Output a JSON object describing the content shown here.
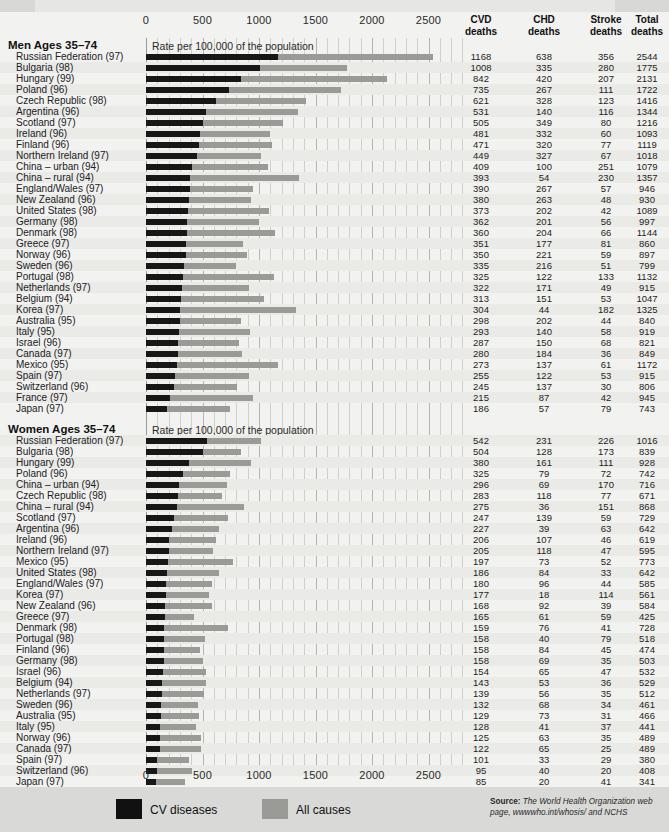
{
  "axis": {
    "ticks": [
      0,
      500,
      1000,
      1500,
      2000,
      2500
    ],
    "tick_labels": [
      "0",
      "500",
      "1000",
      "1500",
      "2000",
      "2500"
    ],
    "min": 0,
    "max": 2800,
    "rate_note": "Rate per 100,000 of the population"
  },
  "columns": {
    "cvd": "CVD\ndeaths",
    "cvd_l1": "CVD",
    "cvd_l2": "deaths",
    "chd_l1": "CHD",
    "chd_l2": "deaths",
    "stroke_l1": "Stroke",
    "stroke_l2": "deaths",
    "total_l1": "Total",
    "total_l2": "deaths"
  },
  "sections": [
    {
      "title": "Men Ages 35–74",
      "rows": [
        {
          "label": "Russian Federation (97)",
          "cvd": 1168,
          "chd": 638,
          "stroke": 356,
          "total": 2544
        },
        {
          "label": "Bulgaria (98)",
          "cvd": 1008,
          "chd": 335,
          "stroke": 280,
          "total": 1775
        },
        {
          "label": "Hungary (99)",
          "cvd": 842,
          "chd": 420,
          "stroke": 207,
          "total": 2131
        },
        {
          "label": "Poland (96)",
          "cvd": 735,
          "chd": 267,
          "stroke": 111,
          "total": 1722
        },
        {
          "label": "Czech Republic (98)",
          "cvd": 621,
          "chd": 328,
          "stroke": 123,
          "total": 1416
        },
        {
          "label": "Argentina (96)",
          "cvd": 531,
          "chd": 140,
          "stroke": 116,
          "total": 1344
        },
        {
          "label": "Scotland (97)",
          "cvd": 505,
          "chd": 349,
          "stroke": 80,
          "total": 1216
        },
        {
          "label": "Ireland (96)",
          "cvd": 481,
          "chd": 332,
          "stroke": 60,
          "total": 1093
        },
        {
          "label": "Finland (96)",
          "cvd": 471,
          "chd": 320,
          "stroke": 77,
          "total": 1119
        },
        {
          "label": "Northern Ireland (97)",
          "cvd": 449,
          "chd": 327,
          "stroke": 67,
          "total": 1018
        },
        {
          "label": "China – urban (94)",
          "cvd": 409,
          "chd": 100,
          "stroke": 251,
          "total": 1079
        },
        {
          "label": "China – rural (94)",
          "cvd": 393,
          "chd": 54,
          "stroke": 230,
          "total": 1357
        },
        {
          "label": "England/Wales (97)",
          "cvd": 390,
          "chd": 267,
          "stroke": 57,
          "total": 946
        },
        {
          "label": "New Zealand (96)",
          "cvd": 380,
          "chd": 263,
          "stroke": 48,
          "total": 930
        },
        {
          "label": "United States (98)",
          "cvd": 373,
          "chd": 202,
          "stroke": 42,
          "total": 1089
        },
        {
          "label": "Germany (98)",
          "cvd": 362,
          "chd": 201,
          "stroke": 56,
          "total": 997
        },
        {
          "label": "Denmark (98)",
          "cvd": 360,
          "chd": 204,
          "stroke": 66,
          "total": 1144
        },
        {
          "label": "Greece (97)",
          "cvd": 351,
          "chd": 177,
          "stroke": 81,
          "total": 860
        },
        {
          "label": "Norway (96)",
          "cvd": 350,
          "chd": 221,
          "stroke": 59,
          "total": 897
        },
        {
          "label": "Sweden (96)",
          "cvd": 335,
          "chd": 216,
          "stroke": 51,
          "total": 799
        },
        {
          "label": "Portugal (98)",
          "cvd": 325,
          "chd": 122,
          "stroke": 133,
          "total": 1132
        },
        {
          "label": "Netherlands (97)",
          "cvd": 322,
          "chd": 171,
          "stroke": 49,
          "total": 915
        },
        {
          "label": "Belgium (94)",
          "cvd": 313,
          "chd": 151,
          "stroke": 53,
          "total": 1047
        },
        {
          "label": "Korea (97)",
          "cvd": 304,
          "chd": 44,
          "stroke": 182,
          "total": 1325
        },
        {
          "label": "Australia (95)",
          "cvd": 298,
          "chd": 202,
          "stroke": 44,
          "total": 840
        },
        {
          "label": "Italy (95)",
          "cvd": 293,
          "chd": 140,
          "stroke": 58,
          "total": 919
        },
        {
          "label": "Israel (96)",
          "cvd": 287,
          "chd": 150,
          "stroke": 68,
          "total": 821
        },
        {
          "label": "Canada (97)",
          "cvd": 280,
          "chd": 184,
          "stroke": 36,
          "total": 849
        },
        {
          "label": "Mexico (95)",
          "cvd": 273,
          "chd": 137,
          "stroke": 61,
          "total": 1172
        },
        {
          "label": "Spain (97)",
          "cvd": 255,
          "chd": 122,
          "stroke": 53,
          "total": 915
        },
        {
          "label": "Switzerland (96)",
          "cvd": 245,
          "chd": 137,
          "stroke": 30,
          "total": 806
        },
        {
          "label": "France (97)",
          "cvd": 215,
          "chd": 87,
          "stroke": 42,
          "total": 945
        },
        {
          "label": "Japan (97)",
          "cvd": 186,
          "chd": 57,
          "stroke": 79,
          "total": 743
        }
      ]
    },
    {
      "title": "Women Ages 35–74",
      "rows": [
        {
          "label": "Russian Federation (97)",
          "cvd": 542,
          "chd": 231,
          "stroke": 226,
          "total": 1016
        },
        {
          "label": "Bulgaria (98)",
          "cvd": 504,
          "chd": 128,
          "stroke": 173,
          "total": 839
        },
        {
          "label": "Hungary (99)",
          "cvd": 380,
          "chd": 161,
          "stroke": 111,
          "total": 928
        },
        {
          "label": "Poland (96)",
          "cvd": 325,
          "chd": 79,
          "stroke": 72,
          "total": 742
        },
        {
          "label": "China – urban (94)",
          "cvd": 296,
          "chd": 69,
          "stroke": 170,
          "total": 716
        },
        {
          "label": "Czech Republic (98)",
          "cvd": 283,
          "chd": 118,
          "stroke": 77,
          "total": 671
        },
        {
          "label": "China – rural (94)",
          "cvd": 275,
          "chd": 36,
          "stroke": 151,
          "total": 868
        },
        {
          "label": "Scotland (97)",
          "cvd": 247,
          "chd": 139,
          "stroke": 59,
          "total": 729
        },
        {
          "label": "Argentina (96)",
          "cvd": 227,
          "chd": 39,
          "stroke": 63,
          "total": 642
        },
        {
          "label": "Ireland (96)",
          "cvd": 206,
          "chd": 107,
          "stroke": 46,
          "total": 619
        },
        {
          "label": "Northern Ireland (97)",
          "cvd": 205,
          "chd": 118,
          "stroke": 47,
          "total": 595
        },
        {
          "label": "Mexico (95)",
          "cvd": 197,
          "chd": 73,
          "stroke": 52,
          "total": 773
        },
        {
          "label": "United States (98)",
          "cvd": 186,
          "chd": 84,
          "stroke": 33,
          "total": 642
        },
        {
          "label": "England/Wales (97)",
          "cvd": 180,
          "chd": 96,
          "stroke": 44,
          "total": 585
        },
        {
          "label": "Korea (97)",
          "cvd": 177,
          "chd": 18,
          "stroke": 114,
          "total": 561
        },
        {
          "label": "New Zealand (96)",
          "cvd": 168,
          "chd": 92,
          "stroke": 39,
          "total": 584
        },
        {
          "label": "Greece (97)",
          "cvd": 165,
          "chd": 61,
          "stroke": 59,
          "total": 425
        },
        {
          "label": "Denmark (98)",
          "cvd": 159,
          "chd": 76,
          "stroke": 41,
          "total": 728
        },
        {
          "label": "Portugal (98)",
          "cvd": 158,
          "chd": 40,
          "stroke": 79,
          "total": 518
        },
        {
          "label": "Finland (96)",
          "cvd": 158,
          "chd": 84,
          "stroke": 45,
          "total": 474
        },
        {
          "label": "Germany (98)",
          "cvd": 158,
          "chd": 69,
          "stroke": 35,
          "total": 503
        },
        {
          "label": "Israel (96)",
          "cvd": 154,
          "chd": 65,
          "stroke": 47,
          "total": 532
        },
        {
          "label": "Belgium (94)",
          "cvd": 143,
          "chd": 53,
          "stroke": 36,
          "total": 529
        },
        {
          "label": "Netherlands (97)",
          "cvd": 139,
          "chd": 56,
          "stroke": 35,
          "total": 512
        },
        {
          "label": "Sweden (96)",
          "cvd": 132,
          "chd": 68,
          "stroke": 34,
          "total": 461
        },
        {
          "label": "Australia (95)",
          "cvd": 129,
          "chd": 73,
          "stroke": 31,
          "total": 466
        },
        {
          "label": "Italy (95)",
          "cvd": 128,
          "chd": 41,
          "stroke": 37,
          "total": 441
        },
        {
          "label": "Norway (96)",
          "cvd": 125,
          "chd": 63,
          "stroke": 35,
          "total": 489
        },
        {
          "label": "Canada (97)",
          "cvd": 122,
          "chd": 65,
          "stroke": 25,
          "total": 489
        },
        {
          "label": "Spain (97)",
          "cvd": 101,
          "chd": 33,
          "stroke": 29,
          "total": 380
        },
        {
          "label": "Switzerland (96)",
          "cvd": 95,
          "chd": 40,
          "stroke": 20,
          "total": 408
        },
        {
          "label": "Japan (97)",
          "cvd": 85,
          "chd": 20,
          "stroke": 41,
          "total": 341
        },
        {
          "label": "France (97)",
          "cvd": 76,
          "chd": 20,
          "stroke": 21,
          "total": 396
        }
      ]
    }
  ],
  "legend": [
    {
      "label": "CV diseases",
      "color": "#111111",
      "key": "cvd"
    },
    {
      "label": "All causes",
      "color": "#9a9a97",
      "key": "total"
    }
  ],
  "source": {
    "prefix": "Source:",
    "text": " The World Health Organization web page, wwwwho.int/whosis/ and NCHS"
  },
  "chart_data": {
    "type": "bar",
    "title": "",
    "orientation": "horizontal",
    "xlabel": "Rate per 100,000 of the population",
    "ylabel": "",
    "xlim": [
      0,
      2800
    ],
    "xticks": [
      0,
      500,
      1000,
      1500,
      2000,
      2500
    ],
    "grid": true,
    "legend_position": "bottom",
    "series": [
      {
        "name": "CV diseases",
        "color": "#111111",
        "field": "cvd"
      },
      {
        "name": "All causes",
        "color": "#9a9a97",
        "field": "total"
      }
    ],
    "panels": [
      {
        "name": "Men Ages 35-74",
        "categories": [
          "Russian Federation (97)",
          "Bulgaria (98)",
          "Hungary (99)",
          "Poland (96)",
          "Czech Republic (98)",
          "Argentina (96)",
          "Scotland (97)",
          "Ireland (96)",
          "Finland (96)",
          "Northern Ireland (97)",
          "China – urban (94)",
          "China – rural (94)",
          "England/Wales (97)",
          "New Zealand (96)",
          "United States (98)",
          "Germany (98)",
          "Denmark (98)",
          "Greece (97)",
          "Norway (96)",
          "Sweden (96)",
          "Portugal (98)",
          "Netherlands (97)",
          "Belgium (94)",
          "Korea (97)",
          "Australia (95)",
          "Italy (95)",
          "Israel (96)",
          "Canada (97)",
          "Mexico (95)",
          "Spain (97)",
          "Switzerland (96)",
          "France (97)",
          "Japan (97)"
        ],
        "cvd": [
          1168,
          1008,
          842,
          735,
          621,
          531,
          505,
          481,
          471,
          449,
          409,
          393,
          390,
          380,
          373,
          362,
          360,
          351,
          350,
          335,
          325,
          322,
          313,
          304,
          298,
          293,
          287,
          280,
          273,
          255,
          245,
          215,
          186
        ],
        "chd": [
          638,
          335,
          420,
          267,
          328,
          140,
          349,
          332,
          320,
          327,
          100,
          54,
          267,
          263,
          202,
          201,
          204,
          177,
          221,
          216,
          122,
          171,
          151,
          44,
          202,
          140,
          150,
          184,
          137,
          122,
          137,
          87,
          57
        ],
        "stroke": [
          356,
          280,
          207,
          111,
          123,
          116,
          80,
          60,
          77,
          67,
          251,
          230,
          57,
          48,
          42,
          56,
          66,
          81,
          59,
          51,
          133,
          49,
          53,
          182,
          44,
          58,
          68,
          36,
          61,
          53,
          30,
          42,
          79
        ],
        "total": [
          2544,
          1775,
          2131,
          1722,
          1416,
          1344,
          1216,
          1093,
          1119,
          1018,
          1079,
          1357,
          946,
          930,
          1089,
          997,
          1144,
          860,
          897,
          799,
          1132,
          915,
          1047,
          1325,
          840,
          919,
          821,
          849,
          1172,
          915,
          806,
          945,
          743
        ]
      },
      {
        "name": "Women Ages 35-74",
        "categories": [
          "Russian Federation (97)",
          "Bulgaria (98)",
          "Hungary (99)",
          "Poland (96)",
          "China – urban (94)",
          "Czech Republic (98)",
          "China – rural (94)",
          "Scotland (97)",
          "Argentina (96)",
          "Ireland (96)",
          "Northern Ireland (97)",
          "Mexico (95)",
          "United States (98)",
          "England/Wales (97)",
          "Korea (97)",
          "New Zealand (96)",
          "Greece (97)",
          "Denmark (98)",
          "Portugal (98)",
          "Finland (96)",
          "Germany (98)",
          "Israel (96)",
          "Belgium (94)",
          "Netherlands (97)",
          "Sweden (96)",
          "Australia (95)",
          "Italy (95)",
          "Norway (96)",
          "Canada (97)",
          "Spain (97)",
          "Switzerland (96)",
          "Japan (97)",
          "France (97)"
        ],
        "cvd": [
          542,
          504,
          380,
          325,
          296,
          283,
          275,
          247,
          227,
          206,
          205,
          197,
          186,
          180,
          177,
          168,
          165,
          159,
          158,
          158,
          158,
          154,
          143,
          139,
          132,
          129,
          128,
          125,
          122,
          101,
          95,
          85,
          76
        ],
        "chd": [
          231,
          128,
          161,
          79,
          69,
          118,
          36,
          139,
          39,
          107,
          118,
          73,
          84,
          96,
          18,
          92,
          61,
          76,
          40,
          84,
          69,
          65,
          53,
          56,
          68,
          73,
          41,
          63,
          65,
          33,
          40,
          20,
          20
        ],
        "stroke": [
          226,
          173,
          111,
          72,
          170,
          77,
          151,
          59,
          63,
          46,
          47,
          52,
          33,
          44,
          114,
          39,
          59,
          41,
          79,
          45,
          35,
          47,
          36,
          35,
          34,
          31,
          37,
          35,
          25,
          29,
          20,
          41,
          21
        ],
        "total": [
          1016,
          839,
          928,
          742,
          716,
          671,
          868,
          729,
          642,
          619,
          595,
          773,
          642,
          585,
          561,
          584,
          425,
          728,
          518,
          474,
          503,
          532,
          529,
          512,
          461,
          466,
          441,
          489,
          489,
          380,
          408,
          341,
          396
        ]
      }
    ]
  }
}
